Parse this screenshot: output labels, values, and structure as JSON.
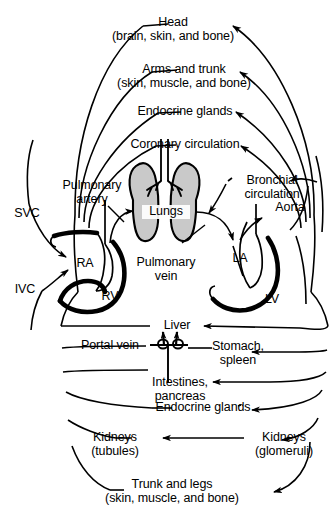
{
  "figure": {
    "background_color": "#ffffff",
    "line_color": "#000000",
    "lung_fill_color": "#c9c9c9"
  },
  "upper_body_targets": [
    {
      "id": "head",
      "line1": "Head",
      "line2": "(brain, skin, and bone)"
    },
    {
      "id": "arms-trunk",
      "line1": "Arms and trunk",
      "line2": "(skin, muscle, and bone)"
    },
    {
      "id": "endocrine-upper",
      "line1": "Endocrine glands",
      "line2": ""
    },
    {
      "id": "coronary",
      "line1": "Coronary circulation",
      "line2": ""
    }
  ],
  "lower_body_targets": [
    {
      "id": "liver",
      "line1": "Liver",
      "line2": ""
    },
    {
      "id": "stomach-spleen",
      "line1": "Stomach,",
      "line2": "spleen"
    },
    {
      "id": "intestines-pancreas",
      "line1": "Intestines,",
      "line2": "pancreas"
    },
    {
      "id": "endocrine-lower",
      "line1": "Endocrine glands",
      "line2": ""
    },
    {
      "id": "kidneys-tubules",
      "line1": "Kidneys",
      "line2": "(tubules)"
    },
    {
      "id": "kidneys-glomeruli",
      "line1": "Kidneys",
      "line2": "(glomeruli)"
    },
    {
      "id": "trunk-legs",
      "line1": "Trunk and legs",
      "line2": "(skin, muscle, and bone)"
    }
  ],
  "central_organs": {
    "lungs": "Lungs",
    "portal_vein": "Portal vein"
  },
  "heart_chambers": {
    "right_atrium": "RA",
    "right_ventricle": "RV",
    "left_atrium": "LA",
    "left_ventricle": "LV"
  },
  "vessels": {
    "svc": "SVC",
    "ivc": "IVC",
    "aorta": "Aorta",
    "pulmonary_artery_line1": "Pulmonary",
    "pulmonary_artery_line2": "artery",
    "pulmonary_vein_line1": "Pulmonary",
    "pulmonary_vein_line2": "vein",
    "bronchial_line1": "Bronchial",
    "bronchial_line2": "circulation"
  }
}
